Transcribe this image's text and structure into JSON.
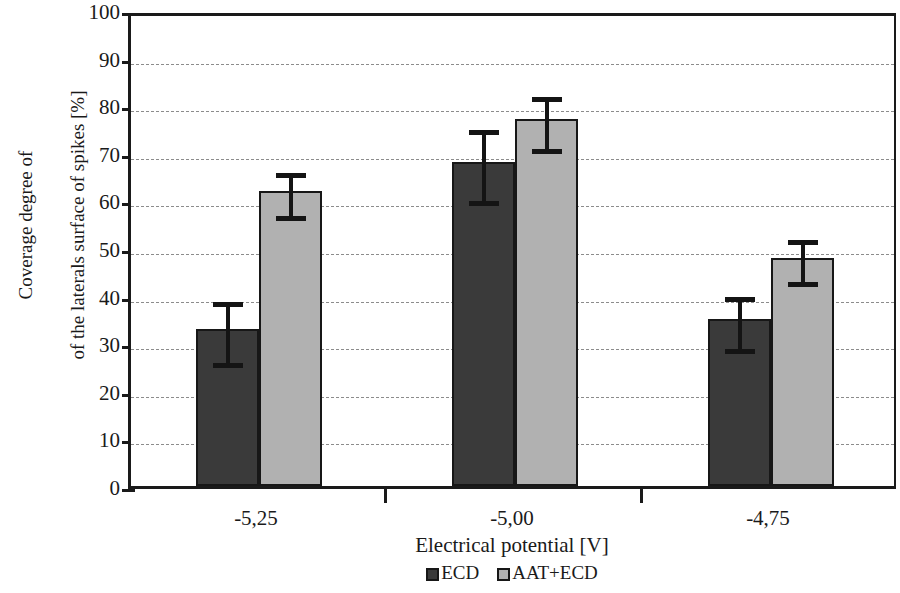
{
  "chart_data": {
    "type": "bar",
    "title": "",
    "xlabel": "Electrical potential [V]",
    "ylabel": "Coverage degree of\nof the laterals surface of spikes [%]",
    "categories": [
      "-5,25",
      "-5,00",
      "-4,75"
    ],
    "ylim": [
      0,
      100
    ],
    "yticks": [
      0,
      10,
      20,
      30,
      40,
      50,
      60,
      70,
      80,
      90,
      100
    ],
    "ytick_labels": [
      "0",
      "10",
      "20",
      "30",
      "40",
      "50",
      "60",
      "70",
      "80",
      "90",
      "100"
    ],
    "grid": "horizontal-dashed",
    "legend_position": "bottom-center",
    "series": [
      {
        "name": "ECD",
        "color": "#3a3a3a",
        "values": [
          33,
          68,
          35
        ],
        "errors": [
          7,
          8,
          6
        ],
        "error_low": [
          26,
          60,
          29
        ],
        "error_high": [
          40,
          76,
          41
        ]
      },
      {
        "name": "AAT+ECD",
        "color": "#b1b1b1",
        "values": [
          62,
          77,
          48
        ],
        "errors": [
          5,
          6,
          5
        ],
        "error_low": [
          57,
          71,
          43
        ],
        "error_high": [
          67,
          83,
          53
        ]
      }
    ]
  },
  "axes": {
    "y_title_line1": "Coverage degree of",
    "y_title_line2": "of the laterals surface of spikes [%]",
    "x_title": "Electrical potential [V]"
  },
  "legend": {
    "items": [
      {
        "label": "ECD",
        "color": "#3a3a3a"
      },
      {
        "label": "AAT+ECD",
        "color": "#b1b1b1"
      }
    ]
  }
}
